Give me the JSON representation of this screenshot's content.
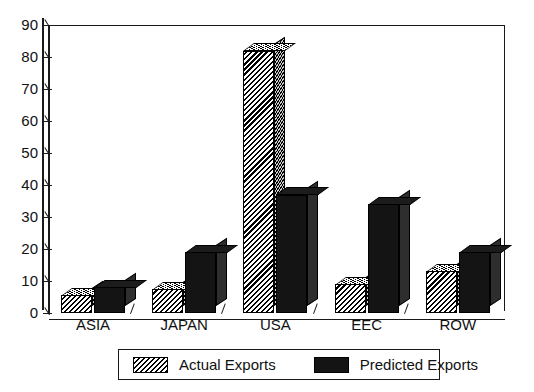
{
  "chart_data": {
    "type": "bar",
    "title": "",
    "subtitle": "",
    "xlabel": "",
    "ylabel": "",
    "ylim": [
      0,
      90
    ],
    "ytick_step": 10,
    "yticks": [
      90,
      80,
      70,
      60,
      50,
      40,
      30,
      20,
      10,
      0
    ],
    "grid": false,
    "legend_position": "bottom",
    "style": "3d-grouped-bars",
    "categories": [
      "ASIA",
      "JAPAN",
      "USA",
      "EEC",
      "ROW"
    ],
    "series": [
      {
        "name": "Actual Exports",
        "pattern": "diagonal-hatch",
        "color": "#2b2b2b",
        "values": [
          5.5,
          7.5,
          82,
          9,
          13
        ]
      },
      {
        "name": "Predicted Exports",
        "pattern": "solid",
        "color": "#141414",
        "values": [
          8,
          19,
          37,
          34,
          19
        ]
      }
    ]
  },
  "legend": {
    "entries": [
      {
        "label": "Actual Exports"
      },
      {
        "label": "Predicted Exports"
      }
    ]
  },
  "axis": {
    "y": {
      "labels": [
        "90",
        "80",
        "70",
        "60",
        "50",
        "40",
        "30",
        "20",
        "10",
        "0"
      ]
    },
    "x": {
      "labels": [
        "ASIA",
        "JAPAN",
        "USA",
        "EEC",
        "ROW"
      ]
    }
  }
}
